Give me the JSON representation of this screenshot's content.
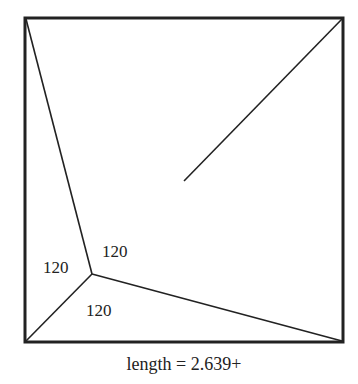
{
  "diagram": {
    "type": "steiner-tree-in-square",
    "square": {
      "x": 25,
      "y": 18,
      "w": 318,
      "h": 324
    },
    "junction": {
      "x": 92,
      "y": 274
    },
    "edges": [
      {
        "from": [
          25,
          18
        ],
        "to": [
          92,
          274
        ]
      },
      {
        "from": [
          92,
          274
        ],
        "to": [
          25,
          342
        ]
      },
      {
        "from": [
          92,
          274
        ],
        "to": [
          343,
          342
        ]
      },
      {
        "from": [
          343,
          18
        ],
        "to": [
          184,
          181
        ]
      }
    ],
    "angle_labels": [
      {
        "text": "120",
        "x": 102,
        "y": 256
      },
      {
        "text": "120",
        "x": 43,
        "y": 273
      },
      {
        "text": "120",
        "x": 86,
        "y": 316
      }
    ],
    "caption": "length = 2.639+"
  }
}
